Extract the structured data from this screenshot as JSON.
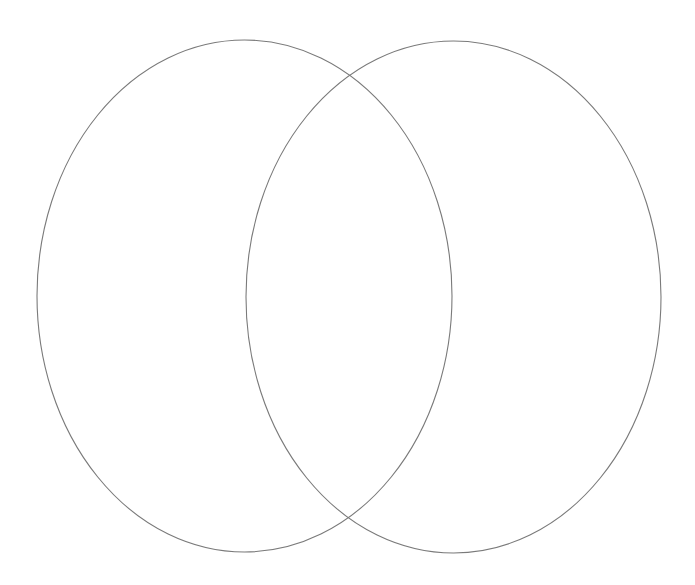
{
  "diagram": {
    "type": "venn",
    "background": "#ffffff",
    "stroke_color": "#7a7a7a",
    "sets": [
      {
        "id": "left-set",
        "label": "",
        "cx": 244.5,
        "cy": 296,
        "rx": 207.5,
        "ry": 256
      },
      {
        "id": "right-set",
        "label": "",
        "cx": 453.5,
        "cy": 297,
        "rx": 207.5,
        "ry": 256
      }
    ]
  }
}
